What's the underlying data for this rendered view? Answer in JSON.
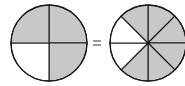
{
  "diagram": {
    "left_circle": {
      "parts": 4,
      "shaded": 3,
      "shaded_slices": [
        0,
        1,
        3
      ]
    },
    "operator": "=",
    "right_circle": {
      "parts": 8,
      "shaded": 6,
      "shaded_slices": [
        0,
        1,
        2,
        5,
        6,
        7
      ]
    },
    "colors": {
      "shade": "#c8c8c8",
      "stroke": "#1a1a1a",
      "background": "#ffffff"
    }
  }
}
